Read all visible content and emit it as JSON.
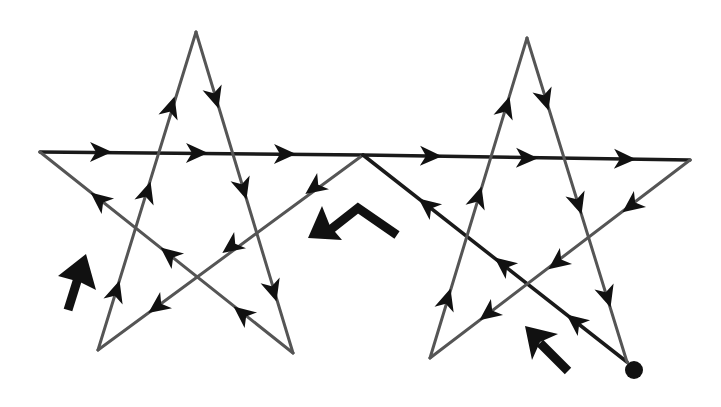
{
  "diagram": {
    "title": "",
    "colors": {
      "background": "#ffffff",
      "line": "#555555",
      "line_dark": "#1a1a1a",
      "arrow": "#111111"
    },
    "stars": [
      {
        "id": "left-star",
        "vertices": {
          "top": [
            196,
            32
          ],
          "left": [
            40,
            152
          ],
          "right": [
            363,
            155
          ],
          "bottom_left": [
            98,
            350
          ],
          "bottom_right": [
            293,
            353
          ]
        }
      },
      {
        "id": "right-star",
        "vertices": {
          "top": [
            527,
            38
          ],
          "left": [
            363,
            155
          ],
          "right": [
            690,
            160
          ],
          "bottom_left": [
            430,
            358
          ],
          "bottom_right": [
            627,
            362
          ]
        }
      }
    ],
    "start_point": {
      "label": "start-dot",
      "position": [
        632,
        371
      ]
    },
    "path_order": [
      "start (right star bottom-right)",
      "up-left to shared vertex",
      "down-left to left star bottom-left",
      "up to left star top",
      "down to left star bottom-right",
      "up-left to left star left vertex",
      "right along horizontal to right star right vertex",
      "down-left to right star bottom-left",
      "up to right star top",
      "down to right star bottom-right"
    ],
    "hint_arrows": [
      {
        "id": "hint-arrow-left",
        "direction": "up"
      },
      {
        "id": "hint-arrow-center",
        "direction": "down-left (bent)"
      },
      {
        "id": "hint-arrow-right",
        "direction": "up-left"
      }
    ]
  }
}
